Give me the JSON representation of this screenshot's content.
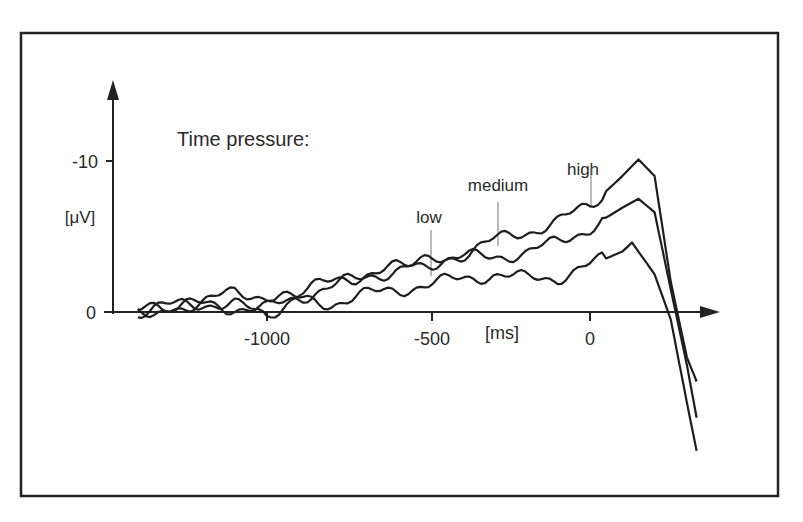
{
  "chart_data": {
    "type": "line",
    "title": "",
    "annotation_title": "Time pressure:",
    "xlabel": "[ms]",
    "ylabel": "[μV]",
    "y_inverted": true,
    "xlim": [
      -1400,
      400
    ],
    "ylim": [
      -13,
      9
    ],
    "x_ticks": [
      -1000,
      -500,
      0
    ],
    "x_tick_labels": [
      "-1000",
      "-500",
      "0"
    ],
    "y_ticks": [
      -10,
      0
    ],
    "y_tick_labels": [
      "-10",
      "0"
    ],
    "grid": false,
    "legend": "inline annotations",
    "series": [
      {
        "name": "high",
        "label_x": 0,
        "x": [
          -1400,
          -1300,
          -1200,
          -1100,
          -1000,
          -900,
          -800,
          -700,
          -600,
          -500,
          -400,
          -300,
          -200,
          -100,
          0,
          100,
          150,
          200,
          250,
          300,
          330
        ],
        "values": [
          0,
          -0.3,
          -0.5,
          -0.3,
          -0.2,
          -1.0,
          -1.7,
          -2.3,
          -2.8,
          -3.3,
          -3.8,
          -4.7,
          -5.3,
          -6.0,
          -7.0,
          -9.0,
          -10.1,
          -9.0,
          -2.0,
          3.0,
          4.6
        ]
      },
      {
        "name": "medium",
        "label_x": -300,
        "x": [
          -1400,
          -1300,
          -1200,
          -1100,
          -1000,
          -900,
          -800,
          -700,
          -600,
          -500,
          -400,
          -300,
          -200,
          -100,
          0,
          100,
          150,
          200,
          250,
          300,
          330
        ],
        "values": [
          0,
          -0.4,
          -0.6,
          -0.5,
          0.3,
          -1.3,
          -2.0,
          -2.5,
          -2.9,
          -3.3,
          -3.6,
          -3.7,
          -3.9,
          -4.6,
          -5.6,
          -6.9,
          -7.5,
          -6.6,
          -1.5,
          3.5,
          7.0
        ]
      },
      {
        "name": "low",
        "label_x": -500,
        "x": [
          -1400,
          -1300,
          -1200,
          -1100,
          -1000,
          -900,
          -800,
          -700,
          -600,
          -500,
          -400,
          -300,
          -200,
          -100,
          0,
          100,
          130,
          200,
          250,
          300,
          330
        ],
        "values": [
          0,
          -0.3,
          -0.6,
          -1.3,
          -1.1,
          -0.8,
          -0.6,
          -1.1,
          -1.5,
          -1.8,
          -2.2,
          -2.5,
          -2.2,
          -2.3,
          -3.1,
          -4.0,
          -4.6,
          -2.5,
          0.5,
          6.0,
          9.2
        ]
      }
    ]
  }
}
